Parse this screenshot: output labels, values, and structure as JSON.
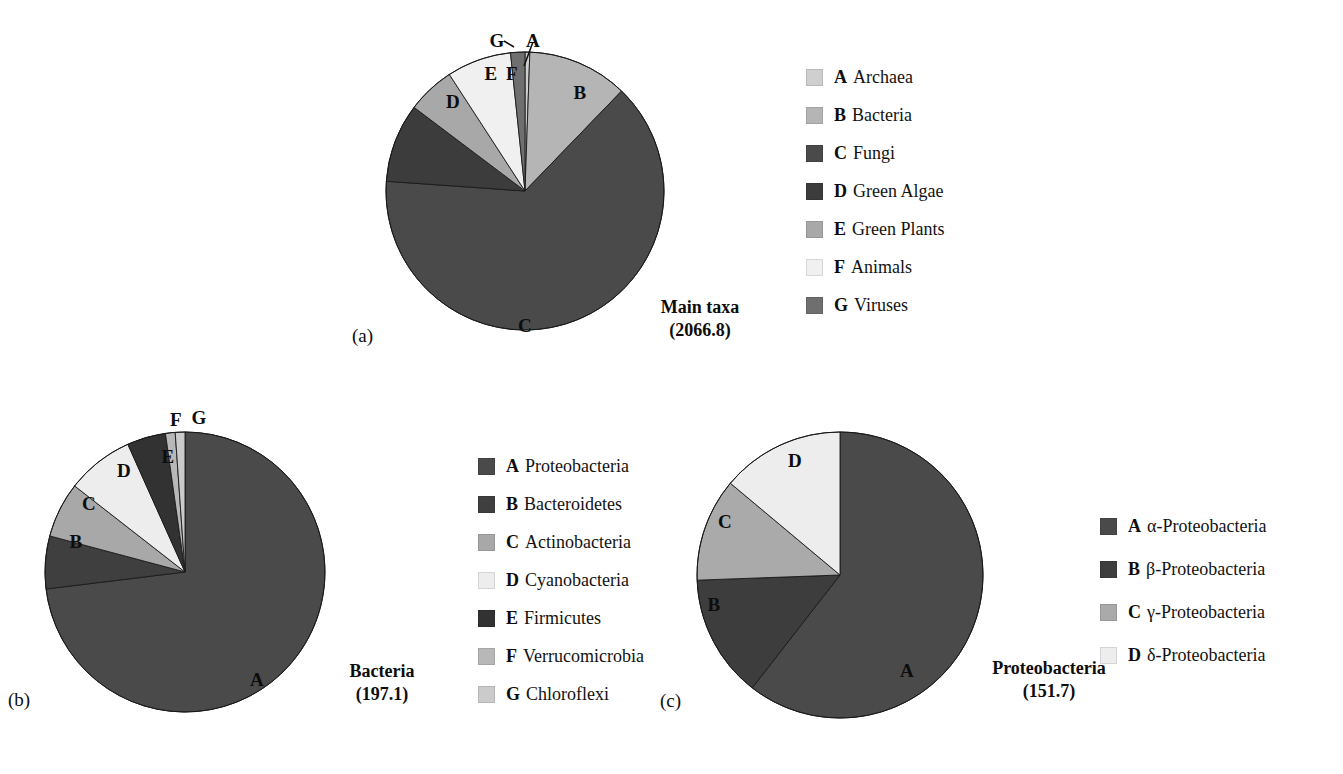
{
  "figure": {
    "background": "#ffffff",
    "panels": [
      {
        "letter": "(a)",
        "caption_line1": "Main taxa",
        "caption_line2": "(2066.8)"
      },
      {
        "letter": "(b)",
        "caption_line1": "Bacteria",
        "caption_line2": "(197.1)"
      },
      {
        "letter": "(c)",
        "caption_line1": "Proteobacteria",
        "caption_line2": "(151.7)"
      }
    ]
  },
  "chart_data": [
    {
      "type": "pie",
      "title": "Main taxa",
      "total": 2066.8,
      "panel": "(a)",
      "start_angle_deg": 0,
      "direction": "clockwise",
      "categories": [
        "A",
        "B",
        "C",
        "D",
        "E",
        "F",
        "G"
      ],
      "labels": [
        "Archaea",
        "Bacteria",
        "Fungi",
        "Green Algae",
        "Green Plants",
        "Animals",
        "Viruses"
      ],
      "values": [
        11.5,
        241.1,
        1320.3,
        189.4,
        114.8,
        155.0,
        34.4
      ],
      "percentages": [
        0.6,
        11.7,
        63.9,
        9.2,
        5.6,
        7.5,
        1.7
      ],
      "colors": [
        "#cfcfcf",
        "#b5b5b5",
        "#4a4a4a",
        "#3c3c3c",
        "#a8a8a8",
        "#f0f0f0",
        "#6f6f6f"
      ],
      "slice_label_positions": [
        {
          "key": "A",
          "x": 533,
          "y": 40,
          "leader": true
        },
        {
          "key": "B",
          "x": 580,
          "y": 92,
          "leader": false
        },
        {
          "key": "C",
          "x": 525,
          "y": 325,
          "leader": false
        },
        {
          "key": "D",
          "x": 453,
          "y": 101,
          "leader": false
        },
        {
          "key": "E",
          "x": 491,
          "y": 73,
          "leader": false
        },
        {
          "key": "F",
          "x": 512,
          "y": 73,
          "leader": false
        },
        {
          "key": "G",
          "x": 497,
          "y": 40,
          "leader": true
        }
      ],
      "legend_position": "right",
      "grid": false
    },
    {
      "type": "pie",
      "title": "Bacteria",
      "total": 197.1,
      "panel": "(b)",
      "start_angle_deg": 0,
      "direction": "clockwise",
      "categories": [
        "A",
        "B",
        "C",
        "D",
        "E",
        "F",
        "G"
      ],
      "labels": [
        "Proteobacteria",
        "Bacteroidetes",
        "Actinobacteria",
        "Cyanobacteria",
        "Firmicutes",
        "Verrucomicrobia",
        "Chloroflexi"
      ],
      "values": [
        144.0,
        12.0,
        12.6,
        15.3,
        8.8,
        2.2,
        2.2
      ],
      "percentages": [
        73.1,
        6.1,
        6.4,
        7.8,
        4.5,
        1.1,
        1.1
      ],
      "colors": [
        "#4a4a4a",
        "#3f3f3f",
        "#a8a8a8",
        "#ededed",
        "#323232",
        "#b8b8b8",
        "#cbcbcb"
      ],
      "slice_label_positions": [
        {
          "key": "A",
          "x": 257,
          "y": 679,
          "leader": false
        },
        {
          "key": "B",
          "x": 76,
          "y": 541,
          "leader": false
        },
        {
          "key": "C",
          "x": 89,
          "y": 503,
          "leader": false
        },
        {
          "key": "D",
          "x": 124,
          "y": 470,
          "leader": false
        },
        {
          "key": "E",
          "x": 168,
          "y": 456,
          "leader": false
        },
        {
          "key": "F",
          "x": 176,
          "y": 419,
          "leader": false
        },
        {
          "key": "G",
          "x": 198,
          "y": 417,
          "leader": false
        }
      ],
      "legend_position": "right",
      "grid": false
    },
    {
      "type": "pie",
      "title": "Proteobacteria",
      "total": 151.7,
      "panel": "(c)",
      "start_angle_deg": 0,
      "direction": "clockwise",
      "categories": [
        "A",
        "B",
        "C",
        "D"
      ],
      "labels": [
        "α-Proteobacteria",
        "β-Proteobacteria",
        "γ-Proteobacteria",
        "δ-Proteobacteria"
      ],
      "values": [
        91.8,
        21.1,
        17.7,
        21.1
      ],
      "percentages": [
        60.5,
        13.9,
        11.7,
        13.9
      ],
      "colors": [
        "#4a4a4a",
        "#3d3d3d",
        "#aaaaaa",
        "#ededed"
      ],
      "slice_label_positions": [
        {
          "key": "A",
          "x": 907,
          "y": 670,
          "leader": false
        },
        {
          "key": "B",
          "x": 714,
          "y": 604,
          "leader": false
        },
        {
          "key": "C",
          "x": 725,
          "y": 521,
          "leader": false
        },
        {
          "key": "D",
          "x": 795,
          "y": 460,
          "leader": false
        }
      ],
      "legend_position": "right",
      "grid": false
    }
  ],
  "legends": [
    {
      "id": "legend-main-taxa",
      "items": [
        {
          "key": "A",
          "label": "Archaea",
          "color": "#cfcfcf"
        },
        {
          "key": "B",
          "label": "Bacteria",
          "color": "#b5b5b5"
        },
        {
          "key": "C",
          "label": "Fungi",
          "color": "#4a4a4a"
        },
        {
          "key": "D",
          "label": "Green Algae",
          "color": "#3c3c3c"
        },
        {
          "key": "E",
          "label": "Green Plants",
          "color": "#a8a8a8"
        },
        {
          "key": "F",
          "label": "Animals",
          "color": "#f0f0f0"
        },
        {
          "key": "G",
          "label": "Viruses",
          "color": "#6f6f6f"
        }
      ]
    },
    {
      "id": "legend-bacteria",
      "items": [
        {
          "key": "A",
          "label": "Proteobacteria",
          "color": "#4a4a4a"
        },
        {
          "key": "B",
          "label": "Bacteroidetes",
          "color": "#3f3f3f"
        },
        {
          "key": "C",
          "label": "Actinobacteria",
          "color": "#a8a8a8"
        },
        {
          "key": "D",
          "label": "Cyanobacteria",
          "color": "#ededed"
        },
        {
          "key": "E",
          "label": "Firmicutes",
          "color": "#323232"
        },
        {
          "key": "F",
          "label": "Verrucomicrobia",
          "color": "#b8b8b8"
        },
        {
          "key": "G",
          "label": "Chloroflexi",
          "color": "#cbcbcb"
        }
      ]
    },
    {
      "id": "legend-proteobacteria",
      "items": [
        {
          "key": "A",
          "label": "α-Proteobacteria",
          "color": "#4a4a4a"
        },
        {
          "key": "B",
          "label": "β-Proteobacteria",
          "color": "#3d3d3d"
        },
        {
          "key": "C",
          "label": "γ-Proteobacteria",
          "color": "#aaaaaa"
        },
        {
          "key": "D",
          "label": "δ-Proteobacteria",
          "color": "#ededed"
        }
      ]
    }
  ]
}
